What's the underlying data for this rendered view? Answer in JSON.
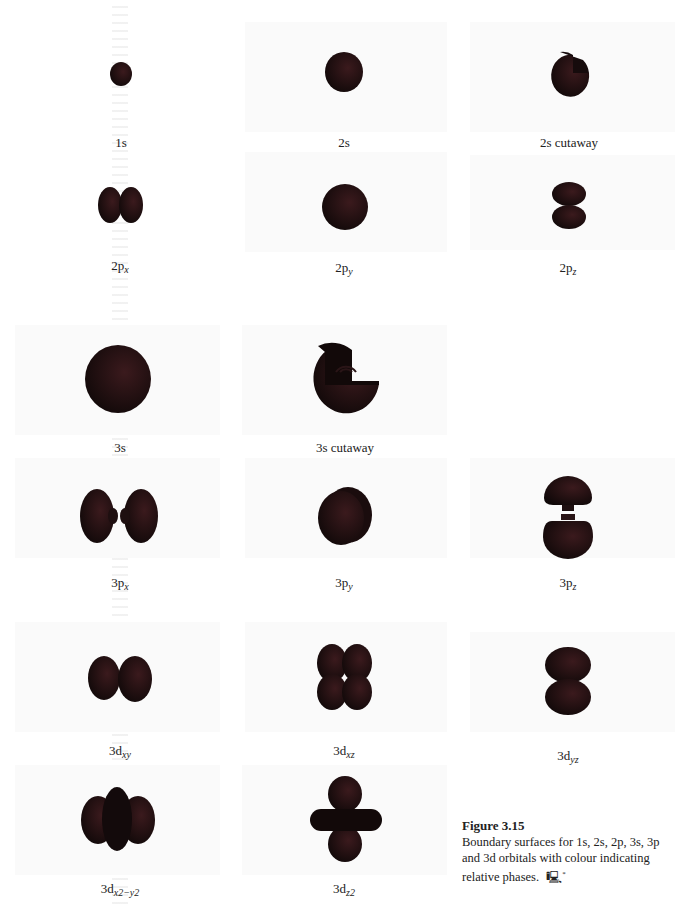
{
  "figure": {
    "number": "Figure 3.15",
    "caption": "Boundary surfaces for 1s, 2s, 2p, 3s, 3p and 3d orbitals with colour indicating relative phases.",
    "caption_icon": "computer-icon"
  },
  "colors": {
    "orbital_fill": "#1a0f10",
    "orbital_highlight": "#3a1a1c",
    "background": "#ffffff",
    "panel": "#f7f7f7"
  },
  "orbitals": [
    {
      "id": "1s",
      "main": "1s",
      "sub": ""
    },
    {
      "id": "2s",
      "main": "2s",
      "sub": ""
    },
    {
      "id": "2s-cutaway",
      "main": "2s cutaway",
      "sub": ""
    },
    {
      "id": "2px",
      "main": "2p",
      "sub": "x"
    },
    {
      "id": "2py",
      "main": "2p",
      "sub": "y"
    },
    {
      "id": "2pz",
      "main": "2p",
      "sub": "z"
    },
    {
      "id": "3s",
      "main": "3s",
      "sub": ""
    },
    {
      "id": "3s-cutaway",
      "main": "3s cutaway",
      "sub": ""
    },
    {
      "id": "3px",
      "main": "3p",
      "sub": "x"
    },
    {
      "id": "3py",
      "main": "3p",
      "sub": "y"
    },
    {
      "id": "3pz",
      "main": "3p",
      "sub": "z"
    },
    {
      "id": "3dxy",
      "main": "3d",
      "sub": "xy"
    },
    {
      "id": "3dxz",
      "main": "3d",
      "sub": "xz"
    },
    {
      "id": "3dyz",
      "main": "3d",
      "sub": "yz"
    },
    {
      "id": "3dx2-y2",
      "main": "3d",
      "sub": "x2−y2"
    },
    {
      "id": "3dz2",
      "main": "3d",
      "sub": "z2"
    }
  ]
}
